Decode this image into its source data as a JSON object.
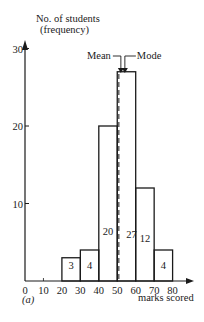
{
  "chart_data": {
    "type": "bar",
    "subtype": "histogram",
    "title": "",
    "panel_label": "(a)",
    "xlabel": "marks scored",
    "ylabel_line1": "No. of students",
    "ylabel_line2": "(frequency)",
    "x_ticks": [
      0,
      10,
      20,
      30,
      40,
      50,
      60,
      70,
      80
    ],
    "y_ticks": [
      10,
      20,
      30
    ],
    "xlim": [
      0,
      80
    ],
    "ylim": [
      0,
      30
    ],
    "grid": false,
    "bins": [
      {
        "from": 20,
        "to": 30,
        "value": 3
      },
      {
        "from": 30,
        "to": 40,
        "value": 4
      },
      {
        "from": 40,
        "to": 50,
        "value": 20
      },
      {
        "from": 50,
        "to": 60,
        "value": 27
      },
      {
        "from": 60,
        "to": 70,
        "value": 12
      },
      {
        "from": 70,
        "to": 80,
        "value": 4
      }
    ],
    "categories": [
      "20-30",
      "30-40",
      "40-50",
      "50-60",
      "60-70",
      "70-80"
    ],
    "values": [
      3,
      4,
      20,
      27,
      12,
      4
    ],
    "annotations": [
      {
        "label": "Mean",
        "x": 52.5,
        "style": "dashed"
      },
      {
        "label": "Mode",
        "x": 55,
        "style": "solid-arrow"
      }
    ],
    "colors": {
      "line": "#1a1a1a",
      "background": "#ffffff"
    }
  }
}
